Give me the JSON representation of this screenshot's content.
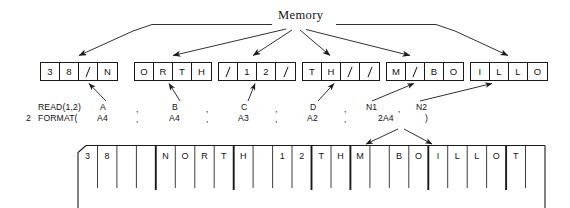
{
  "diagram": {
    "memory_label": "Memory"
  },
  "memory": {
    "groups": [
      {
        "name": "A",
        "cells": [
          {
            "ch": "3",
            "slashed": false
          },
          {
            "ch": "8",
            "slashed": false
          },
          {
            "ch": "",
            "slashed": true
          },
          {
            "ch": "N",
            "slashed": false
          }
        ]
      },
      {
        "name": "B",
        "cells": [
          {
            "ch": "O",
            "slashed": false
          },
          {
            "ch": "R",
            "slashed": false
          },
          {
            "ch": "T",
            "slashed": false
          },
          {
            "ch": "H",
            "slashed": false
          }
        ]
      },
      {
        "name": "C",
        "cells": [
          {
            "ch": "",
            "slashed": true
          },
          {
            "ch": "1",
            "slashed": false
          },
          {
            "ch": "2",
            "slashed": false
          },
          {
            "ch": "",
            "slashed": true
          }
        ]
      },
      {
        "name": "D",
        "cells": [
          {
            "ch": "T",
            "slashed": false
          },
          {
            "ch": "H",
            "slashed": false
          },
          {
            "ch": "",
            "slashed": true
          },
          {
            "ch": "",
            "slashed": true
          }
        ]
      },
      {
        "name": "N1",
        "cells": [
          {
            "ch": "M",
            "slashed": false
          },
          {
            "ch": "",
            "slashed": true
          },
          {
            "ch": "B",
            "slashed": false
          },
          {
            "ch": "O",
            "slashed": false
          }
        ]
      },
      {
        "name": "N2",
        "cells": [
          {
            "ch": "I",
            "slashed": false
          },
          {
            "ch": "L",
            "slashed": false
          },
          {
            "ch": "L",
            "slashed": false
          },
          {
            "ch": "O",
            "slashed": false
          }
        ]
      }
    ]
  },
  "code": {
    "read_statement": "READ(1,2)",
    "format_label": "2",
    "format_statement": "FORMAT(",
    "variables": [
      "A",
      "B",
      "C",
      "D",
      "N1",
      "N2"
    ],
    "formats": [
      "A4",
      "A4",
      "A3",
      "A2",
      "2A4"
    ],
    "separator": ",",
    "close_paren": ")"
  },
  "card": {
    "columns": [
      "3",
      "8",
      " ",
      " ",
      "N",
      "O",
      "R",
      "T",
      "H",
      " ",
      "1",
      "2",
      "T",
      "H",
      "M",
      " ",
      "B",
      "O",
      "I",
      "L",
      "L",
      "O",
      "T",
      " "
    ],
    "field_breaks": [
      4,
      8,
      12,
      14,
      18,
      22
    ]
  }
}
